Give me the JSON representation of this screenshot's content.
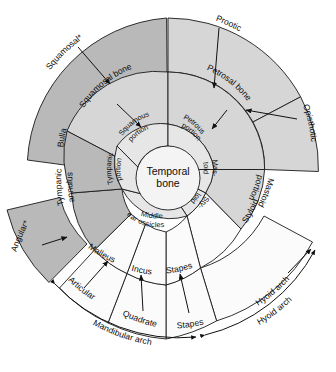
{
  "figure": {
    "type": "radial-hierarchy-diagram",
    "center_label_line1": "Temporal",
    "center_label_line2": "bone",
    "colors": {
      "outer_ring": "#b9b9b9",
      "middle_ring": "#d6d6d6",
      "inner_ring": "#e6e6e6",
      "white_ring": "#fbfbfb",
      "hub": "#f4f4f4",
      "stroke": "#1a1a1a"
    }
  },
  "inner_ring": {
    "items": [
      {
        "id": "squamous-portion",
        "line1": "Squamous",
        "line2": "portion"
      },
      {
        "id": "petrous-portion",
        "line1": "Petrous",
        "line2": "portion"
      },
      {
        "id": "mastoid-portion",
        "line1": "Mas-",
        "line2": "toid"
      },
      {
        "id": "styloid-portion",
        "line1": "Sty-",
        "line2": "loid"
      },
      {
        "id": "middle-ear-ossicles",
        "line1": "Middle",
        "line2": "ear ossicles"
      },
      {
        "id": "tympanic-portion",
        "line1": "Tympanic",
        "line2": "portion"
      }
    ]
  },
  "middle_ring": {
    "items": [
      {
        "id": "squamosal-bone",
        "label": "Squamosal bone"
      },
      {
        "id": "petrosal-bone",
        "label": "Petrosal bone"
      },
      {
        "id": "mastoid-portion-mid",
        "line1": "Mastoid",
        "line2": "portion"
      },
      {
        "id": "styloid",
        "label": "Styloid"
      },
      {
        "id": "stapes",
        "label": "Stapes"
      },
      {
        "id": "incus",
        "label": "Incus"
      },
      {
        "id": "malleus",
        "label": "Malleus"
      },
      {
        "id": "tympanic-annulus",
        "line1": "Tympanic",
        "line2": "annulus"
      },
      {
        "id": "bulla",
        "label": "Bulla"
      }
    ]
  },
  "outer_ring": {
    "items": [
      {
        "id": "squamosal",
        "label": "Squamosal*"
      },
      {
        "id": "prootic",
        "label": "Prootic"
      },
      {
        "id": "opisthotic",
        "label": "Opisthotic"
      },
      {
        "id": "hyoid-arch",
        "label": "Hyoid arch"
      },
      {
        "id": "stapes-outer",
        "label": "Stapes"
      },
      {
        "id": "quadrate",
        "label": "Quadrate"
      },
      {
        "id": "articular",
        "label": "Articular"
      },
      {
        "id": "angular",
        "label": "Angular*"
      }
    ]
  },
  "arch_brackets": {
    "items": [
      {
        "id": "mandibular-arch",
        "label": "Mandibular arch"
      },
      {
        "id": "hyoid-arch-bracket",
        "label": "Hyoid arch"
      }
    ]
  }
}
